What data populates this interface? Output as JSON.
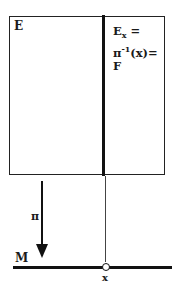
{
  "diagram": {
    "total_space_label": "E",
    "fiber_label": {
      "line1_main": "E",
      "line1_sub": "x",
      "line1_tail": " =",
      "line2_main": "π",
      "line2_sup": "-1",
      "line2_tail": "(x)=",
      "line3": "F"
    },
    "projection_label": "π",
    "base_space_label": "M",
    "point_label": "x"
  },
  "colors": {
    "ink": "#111111",
    "background": "#ffffff"
  }
}
